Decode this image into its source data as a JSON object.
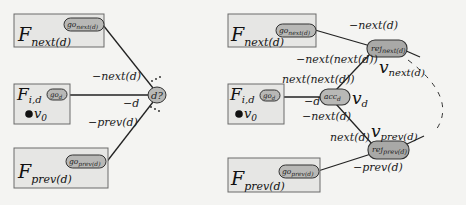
{
  "colors": {
    "background": "#f4f4f2",
    "box_fill": "#e6e6e4",
    "box_stroke": "#6a6a6a",
    "pill_fill": "#b8b8b6",
    "line": "#222222"
  },
  "left": {
    "boxes": {
      "next": {
        "F": "F",
        "sub": "next(d)",
        "go": "go",
        "go_sub": "next(d)"
      },
      "id": {
        "F": "F",
        "sub": "i,d",
        "go": "go",
        "go_sub": "d",
        "v": "v",
        "v_sub": "0"
      },
      "prev": {
        "F": "F",
        "sub": "prev(d)",
        "go": "go",
        "go_sub": "prev(d)"
      }
    },
    "center_node": "d?",
    "edges": {
      "next": "−next(d)",
      "d": "−d",
      "prev": "−prev(d)"
    },
    "ellipsis": "..."
  },
  "right": {
    "boxes": {
      "next": {
        "F": "F",
        "sub": "next(d)",
        "go": "go",
        "go_sub": "next(d)"
      },
      "id": {
        "F": "F",
        "sub": "i,d",
        "go": "go",
        "go_sub": "d",
        "v": "v",
        "v_sub": "0"
      },
      "prev": {
        "F": "F",
        "sub": "prev(d)",
        "go": "go",
        "go_sub": "prev(d)"
      }
    },
    "nodes": {
      "acc": {
        "main": "acc",
        "sub": "d"
      },
      "rej_next": {
        "main": "rej",
        "sub": "next(d)"
      },
      "rej_prev": {
        "main": "rej",
        "sub": "prev(d)"
      }
    },
    "edges": {
      "go_next_to_rej": "−next(d)",
      "rej_next_to_acc_upper": "−next(next(d))",
      "rej_next_to_acc_lower": "next(next(d))",
      "id_to_acc": "−d",
      "acc_to_rej_prev_upper": "−next(d)",
      "acc_to_rej_prev_lower": "next(d)",
      "go_prev_to_rej": "−prev(d)"
    },
    "vertex_labels": {
      "v_next": {
        "v": "v",
        "sub": "next(d)"
      },
      "v_d": {
        "v": "v",
        "sub": "d"
      },
      "v_prev": {
        "v": "v",
        "sub": "prev(d)"
      }
    }
  }
}
